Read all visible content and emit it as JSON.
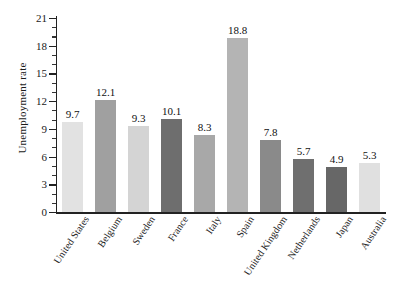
{
  "chart_data": {
    "type": "bar",
    "title": "",
    "xlabel": "",
    "ylabel": "Unemployment rate",
    "ylim": [
      0,
      21
    ],
    "ytick_step": 3,
    "yminor_step": 1,
    "grid": false,
    "legend": "none",
    "categories": [
      "United States",
      "Belgium",
      "Sweden",
      "France",
      "Italy",
      "Spain",
      "United Kingdom",
      "Netherlands",
      "Japan",
      "Australia"
    ],
    "values": [
      9.7,
      12.1,
      9.3,
      10.1,
      8.3,
      18.8,
      7.8,
      5.7,
      4.9,
      5.3
    ],
    "value_labels": [
      "9.7",
      "12.1",
      "9.3",
      "10.1",
      "8.3",
      "18.8",
      "7.8",
      "5.7",
      "4.9",
      "5.3"
    ],
    "bar_colors": [
      "#e2e2e2",
      "#a0a0a0",
      "#d4d4d4",
      "#6e6e6e",
      "#a8a8a8",
      "#b4b4b4",
      "#8a8a8a",
      "#6f6f6f",
      "#676767",
      "#e0e0e0"
    ],
    "ytick_labels": [
      "0",
      "3",
      "6",
      "9",
      "12",
      "15",
      "18",
      "21"
    ],
    "ytick_values": [
      0,
      3,
      6,
      9,
      12,
      15,
      18,
      21
    ],
    "axis_color": "#222222",
    "background": "#ffffff"
  }
}
